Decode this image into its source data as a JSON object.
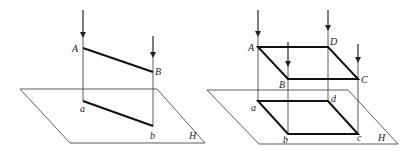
{
  "diagram": {
    "left_figure": {
      "description": "Orthographic projection of line segment AB onto plane H",
      "plane_label": "H",
      "points": [
        {
          "label": "A",
          "type": "space"
        },
        {
          "label": "B",
          "type": "space"
        },
        {
          "label": "a",
          "type": "projection"
        },
        {
          "label": "b",
          "type": "projection"
        }
      ]
    },
    "right_figure": {
      "description": "Orthographic projection of plane figure ABCD onto plane H",
      "plane_label": "H",
      "points": [
        {
          "label": "A",
          "type": "space"
        },
        {
          "label": "D",
          "type": "space"
        },
        {
          "label": "B",
          "type": "space"
        },
        {
          "label": "C",
          "type": "space"
        },
        {
          "label": "a",
          "type": "projection"
        },
        {
          "label": "d",
          "type": "projection"
        },
        {
          "label": "b",
          "type": "projection"
        },
        {
          "label": "c",
          "type": "projection"
        }
      ]
    },
    "colors": {
      "line": "#222222",
      "background": "#ffffff"
    }
  }
}
